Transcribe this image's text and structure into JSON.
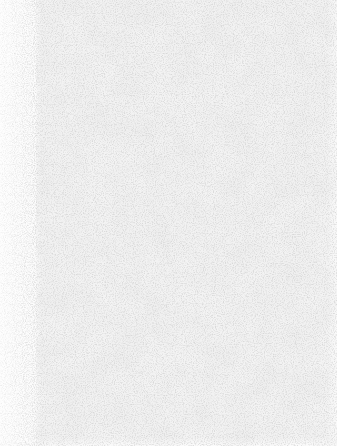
{
  "surface": {
    "description": "blank textured paper-like surface",
    "colors": {
      "base": "#f3f3f3",
      "left_band": "#fdfdfd",
      "speckle": "#9a9a9a"
    }
  }
}
